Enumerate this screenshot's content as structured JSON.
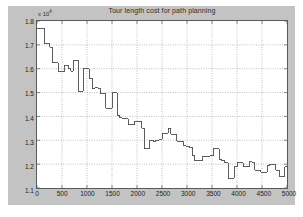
{
  "figure": {
    "background_color": "#c3c3c3",
    "plot_background_color": "#ffffff",
    "axes_color": "#555c5c",
    "grid_color": "#7a7a7a",
    "line_color": "#4a4a4a"
  },
  "chart_data": {
    "type": "line",
    "title": "Tour length cost for path planning",
    "xlabel": "",
    "ylabel": "",
    "y_exponent_label": "x 10",
    "y_exponent_power": "4",
    "grid": true,
    "legend": null,
    "xlim": [
      0,
      5000
    ],
    "ylim": [
      11000,
      18000
    ],
    "xticks": [
      0,
      500,
      1000,
      1500,
      2000,
      2500,
      3000,
      3500,
      4000,
      4500,
      5000
    ],
    "xticklabels": [
      "0",
      "500",
      "1000",
      "1500",
      "2000",
      "2500",
      "3000",
      "3500",
      "4000",
      "4500",
      "5000"
    ],
    "yticks": [
      11000,
      12000,
      13000,
      14000,
      15000,
      16000,
      17000,
      18000
    ],
    "yticklabels": [
      "1.1",
      "1.2",
      "1.3",
      "1.4",
      "1.5",
      "1.6",
      "1.7",
      "1.8"
    ],
    "series": [
      {
        "name": "tour length cost",
        "step": "post",
        "x": [
          0,
          100,
          160,
          250,
          300,
          370,
          430,
          500,
          560,
          620,
          680,
          730,
          780,
          820,
          870,
          920,
          980,
          1040,
          1100,
          1160,
          1220,
          1270,
          1320,
          1380,
          1440,
          1500,
          1550,
          1600,
          1650,
          1700,
          1760,
          1820,
          1880,
          1950,
          2020,
          2090,
          2140,
          2200,
          2260,
          2320,
          2380,
          2440,
          2500,
          2560,
          2620,
          2680,
          2740,
          2800,
          2860,
          2920,
          2980,
          3040,
          3100,
          3160,
          3220,
          3300,
          3380,
          3450,
          3520,
          3580,
          3640,
          3700,
          3760,
          3820,
          3880,
          3940,
          4000,
          4060,
          4120,
          4180,
          4240,
          4300,
          4360,
          4420,
          4480,
          4540,
          4600,
          4660,
          4720,
          4780,
          4840,
          4900,
          4960,
          5000
        ],
        "y": [
          17700,
          17700,
          17050,
          16900,
          16250,
          16250,
          15900,
          15900,
          16150,
          16000,
          15900,
          16350,
          16350,
          15050,
          15050,
          16000,
          16000,
          15600,
          15150,
          15200,
          15150,
          14950,
          14950,
          14350,
          14350,
          15000,
          15000,
          14050,
          13950,
          13900,
          13900,
          13650,
          13650,
          13800,
          13800,
          13500,
          12650,
          12650,
          13000,
          12950,
          13000,
          13050,
          13300,
          13300,
          13500,
          13250,
          13250,
          12950,
          12950,
          12800,
          12750,
          12700,
          12350,
          12150,
          12150,
          12300,
          12300,
          12350,
          12650,
          12650,
          12200,
          12150,
          12050,
          11400,
          11400,
          11900,
          12050,
          12050,
          11900,
          11900,
          12100,
          12050,
          11750,
          11750,
          11650,
          11650,
          11950,
          12000,
          12000,
          11750,
          11500,
          11500,
          11900,
          11900
        ]
      }
    ]
  }
}
